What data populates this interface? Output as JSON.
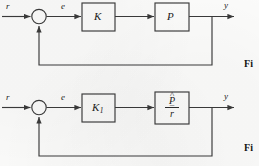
{
  "figure": {
    "type": "control-block-diagram",
    "background_color": "#fbfbfa",
    "line_color": "#3a3a3a",
    "text_color": "#1b1b1b"
  },
  "diagrams": [
    {
      "id": "upper",
      "name": "closed-loop-K-P",
      "input_label": "r",
      "error_label": "e",
      "output_label": "y",
      "summing_junction": "circle-empty",
      "blocks": [
        {
          "name": "controller",
          "label": "K"
        },
        {
          "name": "plant",
          "label": "P"
        }
      ],
      "feedback": "unity-feedback"
    },
    {
      "id": "lower",
      "name": "closed-loop-K1-Phat-over-rbar",
      "input_label": "r",
      "error_label": "e",
      "output_label": "y",
      "summing_junction": "circle-empty",
      "blocks": [
        {
          "name": "controller",
          "label": "K",
          "subscript": "1"
        },
        {
          "name": "plant",
          "label_type": "fraction",
          "numerator": "P",
          "numerator_accent": "^",
          "denominator": "r",
          "denominator_accent": "¯"
        }
      ],
      "feedback": "unity-feedback"
    }
  ],
  "captions": [
    {
      "name": "upper-figure-caption",
      "text": "Fi"
    },
    {
      "name": "lower-figure-caption",
      "text": "Fi"
    }
  ]
}
